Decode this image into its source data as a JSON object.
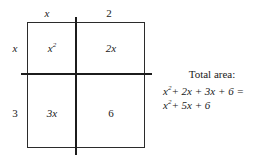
{
  "diagram": {
    "type": "area-model",
    "title_absent": true,
    "column_labels": [
      "x",
      "2"
    ],
    "row_labels": [
      "x",
      "3"
    ],
    "cells": [
      {
        "position": "top-left",
        "value_base": "x",
        "value_exponent": "2",
        "value_text": "x2"
      },
      {
        "position": "top-right",
        "value_text": "2x"
      },
      {
        "position": "bottom-left",
        "value_text": "3x"
      },
      {
        "position": "bottom-right",
        "value_text": "6"
      }
    ],
    "annotation": {
      "heading": "Total area:",
      "line1_base": "x",
      "line1_exponent": "2",
      "line1_rest": "+ 2x + 3x + 6 =",
      "line2_base": "x",
      "line2_exponent": "2",
      "line2_rest": "+ 5x + 6"
    },
    "colors": {
      "background": "#ffffff",
      "ink": "#1a1a1a",
      "outline": "#2b2b2b",
      "divider": "#1c1c1c"
    }
  }
}
